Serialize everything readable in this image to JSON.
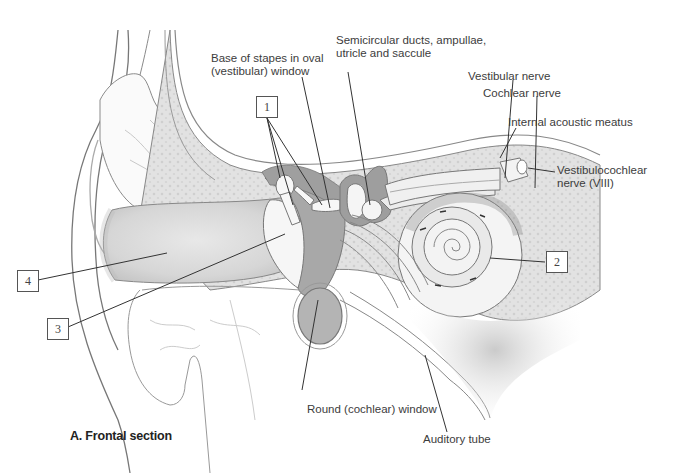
{
  "figure": {
    "caption": "A. Frontal section"
  },
  "labels": {
    "stapes": [
      "Base of stapes in oval",
      "(vestibular) window"
    ],
    "semicircular": [
      "Semicircular ducts, ampullae,",
      "utricle and saccule"
    ],
    "vestibular_nerve": "Vestibular nerve",
    "cochlear_nerve": "Cochlear nerve",
    "internal_meatus": "Internal acoustic meatus",
    "vestibulocochlear": [
      "Vestibulocochlear",
      "nerve (VIII)"
    ],
    "round_window": "Round (cochlear) window",
    "auditory_tube": "Auditory tube"
  },
  "numbered_boxes": [
    {
      "id": "1",
      "target": "auditory ossicles"
    },
    {
      "id": "2",
      "target": "cochlea"
    },
    {
      "id": "3",
      "target": "tympanic membrane"
    },
    {
      "id": "4",
      "target": "external acoustic meatus"
    }
  ],
  "colors": {
    "outline": "#7a7a7a",
    "bone_fill": "#e4e4e4",
    "cavity_fill": "#a9a9a9",
    "canal_fill": "#dcdcdc",
    "leader": "#333333"
  }
}
